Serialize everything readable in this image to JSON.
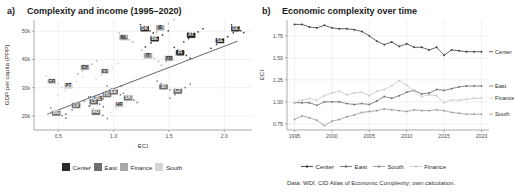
{
  "figure": {
    "caption": "Data: WDI, CID Atlas of Economic Complexity; own calculation."
  },
  "panel_a": {
    "tag": "a)",
    "title": "Complexity and income (1995–2020)",
    "legend": [
      {
        "label": "Center",
        "color": "#2b2b2b"
      },
      {
        "label": "East",
        "color": "#6e6e6e"
      },
      {
        "label": "Finance",
        "color": "#a8a8a8"
      },
      {
        "label": "South",
        "color": "#d4d4d4"
      }
    ]
  },
  "panel_b": {
    "tag": "b)",
    "title": "Economic complexity over time",
    "legend": [
      {
        "label": "Center",
        "color": "#3d3d3d"
      },
      {
        "label": "East",
        "color": "#6e6e6e"
      },
      {
        "label": "South",
        "color": "#9a9a9a"
      },
      {
        "label": "Finance",
        "color": "#c8c8c8"
      }
    ],
    "end_tags": [
      {
        "label": "Center"
      },
      {
        "label": "East"
      },
      {
        "label": "Finance"
      },
      {
        "label": "South"
      }
    ]
  },
  "chart_data": [
    {
      "type": "scatter",
      "panel": "a",
      "title": "Complexity and income (1995–2020)",
      "xlabel": "ECI",
      "ylabel": "GDP per capita (PPP)",
      "xlim": [
        0.28,
        2.25
      ],
      "ylim": [
        15000,
        54000
      ],
      "xticks": [
        0.5,
        1.0,
        1.5,
        2.0
      ],
      "xticklabels": [
        "0.5",
        "1.0",
        "1.5",
        "2.0"
      ],
      "yticks": [
        20000,
        30000,
        40000,
        50000
      ],
      "yticklabels": [
        "20k",
        "30k",
        "40k",
        "50k"
      ],
      "grid": true,
      "legend_position": "bottom",
      "trend_line": {
        "x": [
          0.4,
          2.12
        ],
        "y": [
          20600,
          46500
        ],
        "color": "#555555"
      },
      "groups": {
        "Center": "#2b2b2b",
        "East": "#6e6e6e",
        "Finance": "#a8a8a8",
        "South": "#d4d4d4"
      },
      "points": [
        {
          "code": "DE",
          "group": "Center",
          "x": 2.12,
          "y": 50900
        },
        {
          "code": "SE",
          "group": "Center",
          "x": 1.98,
          "y": 46700
        },
        {
          "code": "AT",
          "group": "Center",
          "x": 1.72,
          "y": 48600
        },
        {
          "code": "FI",
          "group": "Center",
          "x": 1.62,
          "y": 42400
        },
        {
          "code": "DK",
          "group": "Center",
          "x": 1.3,
          "y": 50900
        },
        {
          "code": "BE",
          "group": "Center",
          "x": 1.39,
          "y": 47300
        },
        {
          "code": "FR",
          "group": "Finance",
          "x": 1.52,
          "y": 40400
        },
        {
          "code": "IT",
          "group": "Finance",
          "x": 1.33,
          "y": 41300
        },
        {
          "code": "NL",
          "group": "Finance",
          "x": 1.11,
          "y": 47800
        },
        {
          "code": "IE",
          "group": "Finance",
          "x": 1.44,
          "y": 51200
        },
        {
          "code": "CZ",
          "group": "East",
          "x": 1.6,
          "y": 28800
        },
        {
          "code": "SI",
          "group": "East",
          "x": 1.47,
          "y": 30300
        },
        {
          "code": "SK",
          "group": "East",
          "x": 1.15,
          "y": 26400
        },
        {
          "code": "HU",
          "group": "East",
          "x": 0.96,
          "y": 27600
        },
        {
          "code": "PL",
          "group": "East",
          "x": 0.88,
          "y": 26200
        },
        {
          "code": "EE",
          "group": "East",
          "x": 1.02,
          "y": 28500
        },
        {
          "code": "LT",
          "group": "East",
          "x": 0.84,
          "y": 25000
        },
        {
          "code": "LV",
          "group": "East",
          "x": 0.68,
          "y": 23700
        },
        {
          "code": "HR",
          "group": "South",
          "x": 1.07,
          "y": 23900
        },
        {
          "code": "RO",
          "group": "East",
          "x": 0.86,
          "y": 21300
        },
        {
          "code": "BG",
          "group": "East",
          "x": 0.5,
          "y": 21000
        },
        {
          "code": "PT",
          "group": "South",
          "x": 0.61,
          "y": 30600
        },
        {
          "code": "ES",
          "group": "South",
          "x": 0.94,
          "y": 35800
        },
        {
          "code": "CY",
          "group": "Finance",
          "x": 0.76,
          "y": 37200
        },
        {
          "code": "GR",
          "group": "South",
          "x": 0.46,
          "y": 32200
        }
      ]
    },
    {
      "type": "line",
      "panel": "b",
      "title": "Economic complexity over time",
      "xlabel": "",
      "ylabel": "ECI",
      "xlim": [
        1994,
        2021
      ],
      "ylim": [
        0.68,
        1.93
      ],
      "xticks": [
        1995,
        2000,
        2005,
        2010,
        2015,
        2020
      ],
      "xticklabels": [
        "1995",
        "2000",
        "2005",
        "2010",
        "2015",
        "2020"
      ],
      "yticks": [
        0.75,
        1.0,
        1.25,
        1.5,
        1.75
      ],
      "yticklabels": [
        "0.75",
        "1.00",
        "1.25",
        "1.50",
        "1.75"
      ],
      "grid": true,
      "legend_position": "bottom",
      "x": [
        1995,
        1996,
        1997,
        1998,
        1999,
        2000,
        2001,
        2002,
        2003,
        2004,
        2005,
        2006,
        2007,
        2008,
        2009,
        2010,
        2011,
        2012,
        2013,
        2014,
        2015,
        2016,
        2017,
        2018,
        2019,
        2020
      ],
      "series": [
        {
          "name": "Center",
          "color": "#3d3d3d",
          "values": [
            1.88,
            1.88,
            1.85,
            1.84,
            1.87,
            1.84,
            1.83,
            1.83,
            1.82,
            1.8,
            1.75,
            1.69,
            1.65,
            1.68,
            1.63,
            1.66,
            1.62,
            1.62,
            1.59,
            1.62,
            1.53,
            1.59,
            1.58,
            1.57,
            1.57,
            1.57
          ]
        },
        {
          "name": "East",
          "color": "#6e6e6e",
          "values": [
            0.99,
            0.99,
            0.99,
            0.96,
            1.0,
            1.0,
            1.0,
            0.98,
            0.97,
            0.98,
            0.97,
            1.01,
            1.06,
            1.04,
            1.07,
            1.11,
            1.13,
            1.09,
            1.1,
            1.14,
            1.13,
            1.15,
            1.17,
            1.18,
            1.18,
            1.18
          ]
        },
        {
          "name": "Finance",
          "color": "#c8c8c8",
          "values": [
            0.99,
            1.02,
            1.04,
            1.02,
            1.07,
            1.1,
            1.12,
            1.08,
            1.1,
            1.11,
            1.07,
            1.12,
            1.14,
            1.18,
            1.24,
            1.19,
            1.12,
            1.06,
            1.08,
            1.07,
            0.99,
            1.02,
            1.02,
            1.03,
            1.04,
            1.04
          ]
        },
        {
          "name": "South",
          "color": "#9a9a9a",
          "values": [
            0.8,
            0.84,
            0.82,
            0.79,
            0.73,
            0.78,
            0.8,
            0.83,
            0.85,
            0.88,
            0.89,
            0.9,
            0.92,
            0.91,
            0.9,
            0.89,
            0.91,
            0.9,
            0.9,
            0.91,
            0.9,
            0.88,
            0.87,
            0.86,
            0.86,
            0.86
          ]
        }
      ]
    }
  ]
}
